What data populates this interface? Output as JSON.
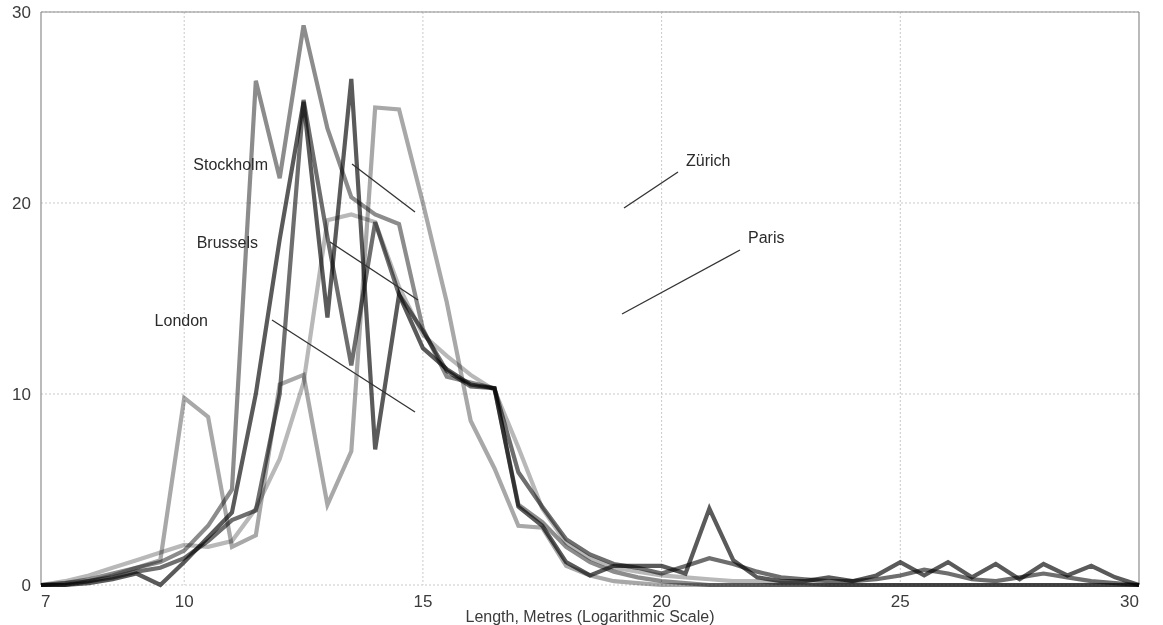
{
  "chart_data": {
    "type": "line",
    "title": "",
    "xlabel": "Length, Metres (Logarithmic Scale)",
    "ylabel": "",
    "xlim": [
      7,
      30
    ],
    "ylim": [
      0,
      30
    ],
    "x_ticks": [
      7,
      10,
      15,
      20,
      25,
      30
    ],
    "y_ticks": [
      0,
      10,
      20,
      30
    ],
    "grid": true,
    "legend_position": "inline-annotations",
    "x": [
      7,
      7.5,
      8,
      8.5,
      9,
      9.5,
      10,
      10.5,
      11,
      11.5,
      12,
      12.5,
      13,
      13.5,
      14,
      14.5,
      15,
      15.5,
      16,
      16.5,
      17,
      17.5,
      18,
      18.5,
      19,
      19.5,
      20,
      20.5,
      21,
      21.5,
      22,
      22.5,
      23,
      23.5,
      24,
      24.5,
      25,
      25.5,
      26,
      26.5,
      27,
      27.5,
      28,
      28.5,
      29,
      29.5,
      30
    ],
    "series": [
      {
        "name": "London",
        "color": "#6e6e6e",
        "values": [
          0,
          0,
          0.2,
          0.4,
          0.7,
          0.9,
          1.4,
          2.3,
          3.4,
          3.9,
          10.0,
          25.4,
          18.2,
          11.5,
          19.0,
          15.2,
          13.3,
          11.2,
          10.4,
          10.3,
          5.9,
          4.1,
          2.4,
          1.6,
          1.1,
          0.9,
          0.6,
          1.0,
          1.4,
          1.1,
          0.7,
          0.4,
          0.3,
          0.2,
          0.2,
          0.3,
          0.5,
          0.8,
          0.6,
          0.3,
          0.2,
          0.4,
          0.6,
          0.4,
          0.2,
          0.1,
          0.0
        ]
      },
      {
        "name": "Brussels",
        "color": "#8c8c8c",
        "values": [
          0,
          0.1,
          0.3,
          0.6,
          0.9,
          1.2,
          1.8,
          3.1,
          5.0,
          26.4,
          21.3,
          29.3,
          23.9,
          20.3,
          19.4,
          18.9,
          13.4,
          10.9,
          10.6,
          10.3,
          4.2,
          3.3,
          2.0,
          1.2,
          0.7,
          0.4,
          0.2,
          0.1,
          0.0,
          0.0,
          0.0,
          0.0,
          0.0,
          0.0,
          0.0,
          0.0,
          0.0,
          0.0,
          0.0,
          0.0,
          0.0,
          0.0,
          0.0,
          0.0,
          0.0,
          0.0,
          0.0
        ]
      },
      {
        "name": "Stockholm",
        "color": "#a8a8a8",
        "values": [
          0,
          0.1,
          0.2,
          0.5,
          0.9,
          1.3,
          9.8,
          8.8,
          2.0,
          2.6,
          10.5,
          11.0,
          4.2,
          7.0,
          25.0,
          24.9,
          20.0,
          14.8,
          8.6,
          6.1,
          3.1,
          3.0,
          1.0,
          0.5,
          0.2,
          0.1,
          0.0,
          0.0,
          0.0,
          0.0,
          0.0,
          0.0,
          0.0,
          0.0,
          0.0,
          0.0,
          0.0,
          0.0,
          0.0,
          0.0,
          0.0,
          0.0,
          0.0,
          0.0,
          0.0,
          0.0,
          0.0
        ]
      },
      {
        "name": "Zürich",
        "color": "#b8b8b8",
        "values": [
          0,
          0.2,
          0.5,
          0.9,
          1.3,
          1.7,
          2.1,
          2.0,
          2.3,
          4.0,
          6.6,
          10.6,
          19.1,
          19.4,
          19.0,
          15.6,
          13.1,
          12.0,
          11.0,
          10.2,
          7.2,
          4.0,
          2.2,
          1.4,
          0.9,
          0.7,
          0.5,
          0.4,
          0.3,
          0.2,
          0.2,
          0.1,
          0.1,
          0.0,
          0.0,
          0.0,
          0.0,
          0.0,
          0.0,
          0.0,
          0.0,
          0.0,
          0.0,
          0.0,
          0.0,
          0.0,
          0.0
        ]
      },
      {
        "name": "Paris",
        "color": "#5a5a5a",
        "values": [
          0,
          0,
          0.1,
          0.3,
          0.6,
          0.0,
          1.2,
          2.5,
          3.8,
          10.0,
          18.1,
          25.3,
          14.0,
          26.5,
          7.1,
          15.2,
          12.4,
          11.3,
          10.5,
          10.3,
          4.1,
          3.1,
          1.2,
          0.5,
          1.0,
          1.0,
          1.0,
          0.6,
          4.0,
          1.3,
          0.4,
          0.2,
          0.2,
          0.4,
          0.2,
          0.5,
          1.2,
          0.5,
          1.2,
          0.4,
          1.1,
          0.3,
          1.1,
          0.5,
          1.0,
          0.4,
          0.0
        ]
      }
    ],
    "annotations": [
      {
        "label": "Stockholm",
        "text_x": 268,
        "text_y": 170,
        "leader": [
          [
            352,
            164
          ],
          [
            415,
            212
          ]
        ]
      },
      {
        "label": "Brussels",
        "text_x": 258,
        "text_y": 248,
        "leader": [
          [
            330,
            242
          ],
          [
            418,
            300
          ]
        ]
      },
      {
        "label": "London",
        "text_x": 208,
        "text_y": 326,
        "leader": [
          [
            272,
            320
          ],
          [
            415,
            412
          ]
        ]
      },
      {
        "label": "Zürich",
        "text_x": 686,
        "text_y": 166,
        "leader": [
          [
            678,
            172
          ],
          [
            624,
            208
          ]
        ]
      },
      {
        "label": "Paris",
        "text_x": 748,
        "text_y": 243,
        "leader": [
          [
            740,
            250
          ],
          [
            622,
            314
          ]
        ]
      }
    ]
  },
  "axis": {
    "y_tick_labels": [
      "0",
      "10",
      "20",
      "30"
    ],
    "x_tick_labels": [
      "7",
      "10",
      "15",
      "20",
      "25",
      "30"
    ],
    "x_title": "Length, Metres (Logarithmic Scale)"
  },
  "style": {
    "background": "#ffffff",
    "grid_color": "#c9c9c9",
    "frame_color": "#8d8d8d",
    "text_color": "#3b3b3b"
  }
}
